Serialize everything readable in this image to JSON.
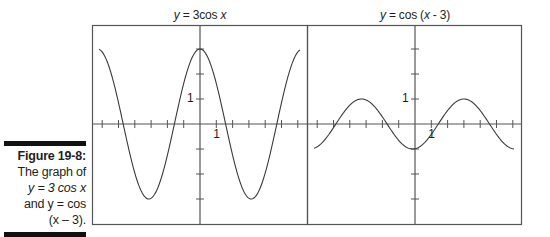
{
  "caption": {
    "title": "Figure 19-8:",
    "lines": [
      "The graph of",
      "y = 3 cos x",
      "and y = cos",
      "(x – 3)."
    ]
  },
  "panels": [
    {
      "title_prefix": "y",
      "title_rest": " = 3cos ",
      "title_var": "x",
      "tick_label_y": "1",
      "tick_label_x": "1"
    },
    {
      "title_prefix": "y",
      "title_rest": " = cos (",
      "title_var": "x",
      "title_tail": " - 3)",
      "tick_label_y": "1",
      "tick_label_x": "1"
    }
  ],
  "colors": {
    "line": "#3a3a3a",
    "frame": "#555555",
    "caption_bar": "#111111",
    "text": "#231f20"
  },
  "chart_data": [
    {
      "type": "line",
      "title": "y = 3cos x",
      "function": "3*cos(x)",
      "xlabel": "",
      "ylabel": "",
      "xlim": [
        -6.2,
        6.2
      ],
      "ylim": [
        -4,
        4
      ],
      "x_ticks_unit": 1,
      "y_ticks_unit": 1,
      "tick_labels": {
        "x": [
          "1"
        ],
        "y": [
          "1"
        ]
      },
      "grid": false,
      "series": [
        {
          "name": "3cos x",
          "x": [
            -6.2832,
            -4.7124,
            -3.1416,
            -1.5708,
            0,
            1.5708,
            3.1416,
            4.7124,
            6.2832
          ],
          "values": [
            3,
            0,
            -3,
            0,
            3,
            0,
            -3,
            0,
            3
          ]
        }
      ]
    },
    {
      "type": "line",
      "title": "y = cos (x - 3)",
      "function": "cos(x-3)",
      "xlabel": "",
      "ylabel": "",
      "xlim": [
        -6.2,
        6.2
      ],
      "ylim": [
        -4,
        4
      ],
      "x_ticks_unit": 1,
      "y_ticks_unit": 1,
      "tick_labels": {
        "x": [
          "1"
        ],
        "y": [
          "1"
        ]
      },
      "grid": false,
      "series": [
        {
          "name": "cos(x-3)",
          "x": [
            -6.2,
            -3.2832,
            -1.4292,
            0,
            1.5708,
            3.0,
            4.5708,
            6.2
          ],
          "values": [
            -1.0,
            1,
            0,
            -0.99,
            0,
            1,
            0,
            -1.0
          ]
        }
      ]
    }
  ]
}
